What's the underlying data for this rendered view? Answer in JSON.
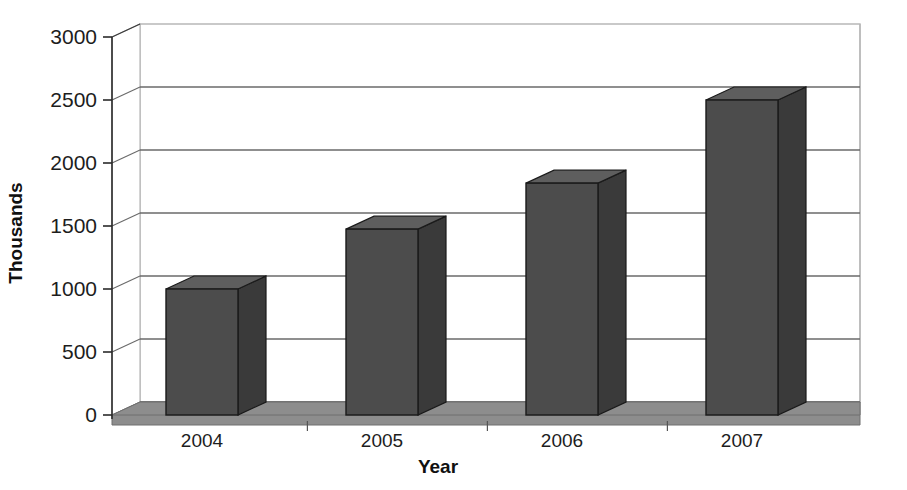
{
  "chart_data": {
    "type": "bar",
    "title": "",
    "subtitle": "",
    "xlabel": "Year",
    "ylabel": "Thousands",
    "categories": [
      "2004",
      "2005",
      "2006",
      "2007"
    ],
    "values": [
      1000,
      1475,
      1840,
      2500
    ],
    "series": [
      {
        "name": "Thousands",
        "values": [
          1000,
          1475,
          1840,
          2500
        ]
      }
    ],
    "ylim": [
      0,
      3000
    ],
    "ytick_labels": [
      "0",
      "500",
      "1000",
      "1500",
      "2000",
      "2500",
      "3000"
    ],
    "ytick_values": [
      0,
      500,
      1000,
      1500,
      2000,
      2500,
      3000
    ],
    "grid": true,
    "legend": false,
    "legend_position": "none",
    "style": "3d-column",
    "colors": {
      "bar_front": "#4c4c4c",
      "bar_side": "#3a3a3a",
      "bar_top": "#5e5e5e",
      "bar_outline": "#1a1a1a",
      "floor": "#8d8d8d",
      "floor_edge": "#6f6f6f",
      "gridline": "#6a6a6a",
      "wall_edge": "#b8b8b8",
      "axis": "#2a2a2a",
      "text": "#1d1d1d",
      "background": "#ffffff"
    }
  },
  "axes": {
    "y_axis_title": "Thousands",
    "x_axis_title": "Year"
  }
}
